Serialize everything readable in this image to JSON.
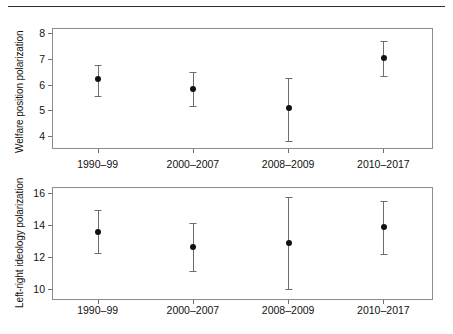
{
  "figure": {
    "has_top_rule": true,
    "background": "#ffffff",
    "marker_color": "#111111",
    "errorbar_color": "#6d6d6d",
    "axis_color": "#8d8d8d"
  },
  "chart_data": [
    {
      "type": "scatter",
      "panel": "top",
      "title": "",
      "xlabel": "",
      "ylabel": "Welfare position polarization",
      "categories": [
        "1990–99",
        "2000–2007",
        "2008–2009",
        "2010–2017"
      ],
      "values": [
        6.2,
        5.85,
        5.08,
        7.02
      ],
      "ci_low": [
        5.56,
        5.18,
        3.8,
        6.33
      ],
      "ci_high": [
        6.78,
        6.48,
        6.27,
        7.68
      ],
      "yticks": [
        4,
        5,
        6,
        7,
        8
      ],
      "ytick_labels": [
        "4",
        "5",
        "6",
        "7",
        "8"
      ],
      "ylim": [
        3.5,
        8.2
      ],
      "grid": false,
      "legend": "none",
      "error_kind": "confidence-interval"
    },
    {
      "type": "scatter",
      "panel": "bottom",
      "title": "",
      "xlabel": "",
      "ylabel": "Left-right ideology polarization",
      "categories": [
        "1990–99",
        "2000–2007",
        "2008–2009",
        "2010–2017"
      ],
      "values": [
        13.55,
        12.6,
        12.85,
        13.85
      ],
      "ci_low": [
        12.25,
        11.1,
        10.0,
        12.2
      ],
      "ci_high": [
        14.9,
        14.1,
        15.7,
        15.5
      ],
      "yticks": [
        10,
        12,
        14,
        16
      ],
      "ytick_labels": [
        "10",
        "12",
        "14",
        "16"
      ],
      "ylim": [
        9.3,
        16.35
      ],
      "grid": false,
      "legend": "none",
      "error_kind": "confidence-interval"
    }
  ]
}
